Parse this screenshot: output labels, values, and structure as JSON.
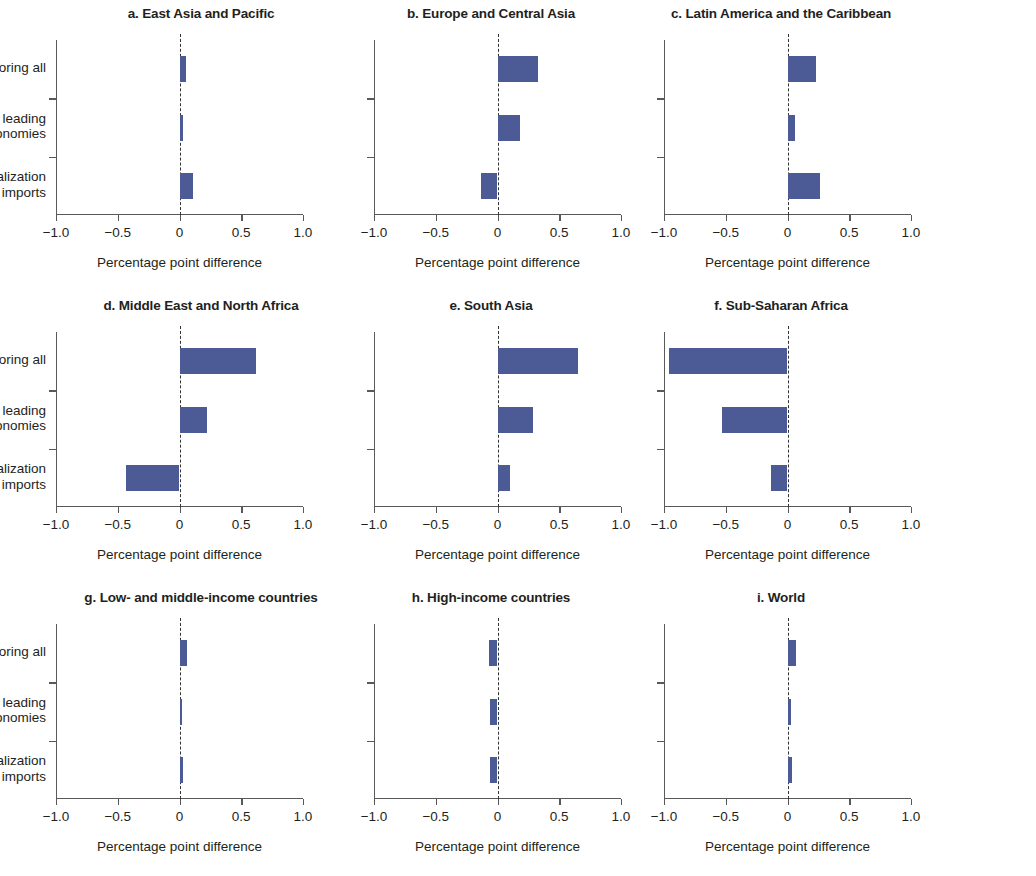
{
  "categories": [
    "Reshoring all",
    "Reshoring leading economies",
    "GVC-friendly liberalization + TF imports"
  ],
  "category_lines": [
    [
      "Reshoring all"
    ],
    [
      "Reshoring leading",
      "economies"
    ],
    [
      "GVC-friendly liberalization",
      "+ TF imports"
    ]
  ],
  "axis": {
    "xlabel": "Percentage point difference",
    "ticks": [
      "−1.0",
      "−0.5",
      "0",
      "0.5",
      "1.0"
    ],
    "tick_values": [
      -1.0,
      -0.5,
      0,
      0.5,
      1.0
    ],
    "xlim": [
      -1.0,
      1.0
    ]
  },
  "colors": {
    "bar": "#4c5a96",
    "axis": "#58595b",
    "text": "#231f20"
  },
  "chart_data": {
    "type": "bar",
    "orientation": "horizontal",
    "title": "",
    "xlabel": "Percentage point difference",
    "ylabel": "",
    "xlim": [
      -1.0,
      1.0
    ],
    "grid": false,
    "legend": "none",
    "categories": [
      "Reshoring all",
      "Reshoring leading economies",
      "GVC-friendly liberalization + TF imports"
    ],
    "panels": [
      {
        "key": "a",
        "title": "a. East Asia and Pacific",
        "values": [
          0.05,
          0.03,
          0.11
        ]
      },
      {
        "key": "b",
        "title": "b. Europe and Central Asia",
        "values": [
          0.33,
          0.18,
          -0.13
        ]
      },
      {
        "key": "c",
        "title": "c. Latin America and the Caribbean",
        "values": [
          0.23,
          0.06,
          0.26
        ]
      },
      {
        "key": "d",
        "title": "d. Middle East and North Africa",
        "values": [
          0.62,
          0.22,
          -0.43
        ]
      },
      {
        "key": "e",
        "title": "e. South Asia",
        "values": [
          0.65,
          0.29,
          0.1
        ]
      },
      {
        "key": "f",
        "title": "f. Sub-Saharan Africa",
        "values": [
          -0.96,
          -0.53,
          -0.13
        ]
      },
      {
        "key": "g",
        "title": "g. Low- and middle-income countries",
        "values": [
          0.06,
          0.02,
          0.03
        ]
      },
      {
        "key": "h",
        "title": "h. High-income countries",
        "values": [
          -0.07,
          -0.06,
          -0.06
        ]
      },
      {
        "key": "i",
        "title": "i. World",
        "values": [
          0.07,
          0.03,
          0.04
        ]
      }
    ]
  }
}
